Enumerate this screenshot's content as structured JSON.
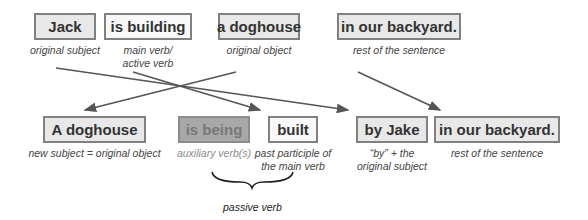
{
  "top_row": [
    {
      "id": "jack",
      "label": "Jack",
      "caption": "original subject",
      "x": 34,
      "w": 62,
      "style": "light"
    },
    {
      "id": "is-building",
      "label": "is building",
      "caption": "main verb/\nactive verb",
      "x": 104,
      "w": 88,
      "style": "white"
    },
    {
      "id": "a-doghouse",
      "label": "a doghouse",
      "caption": "original object",
      "x": 218,
      "w": 82,
      "style": "light"
    },
    {
      "id": "in-our-backyard",
      "label": "in our backyard.",
      "caption": "rest of the sentence",
      "x": 337,
      "w": 124,
      "style": "light"
    }
  ],
  "bottom_row": [
    {
      "id": "a-doghouse-new",
      "label": "A doghouse",
      "caption": "new subject = original object",
      "x": 43,
      "w": 103,
      "style": "light"
    },
    {
      "id": "is-being",
      "label": "is being",
      "caption": "auxiliary verb(s)",
      "x": 178,
      "w": 72,
      "style": "dark"
    },
    {
      "id": "built",
      "label": "built",
      "caption": "past participle of\nthe main verb",
      "x": 268,
      "w": 50,
      "style": "white"
    },
    {
      "id": "by-jake",
      "label": "by Jake",
      "caption": "“by” + the\noriginal subject",
      "x": 356,
      "w": 72,
      "style": "light"
    },
    {
      "id": "in-our-backyard-new",
      "label": "in our backyard.",
      "caption": "rest of the sentence",
      "x": 434,
      "w": 126,
      "style": "light"
    }
  ],
  "arrows": [
    {
      "from": "jack",
      "to": "by-jake",
      "x1": 56,
      "y1": 68,
      "x2": 348,
      "y2": 110
    },
    {
      "from": "is-building",
      "to": "built",
      "x1": 133,
      "y1": 72,
      "x2": 260,
      "y2": 110
    },
    {
      "from": "a-doghouse",
      "to": "a-doghouse-new",
      "x1": 236,
      "y1": 72,
      "x2": 85,
      "y2": 110
    },
    {
      "from": "in-our-backyard",
      "to": "in-our-backyard-new",
      "x1": 358,
      "y1": 72,
      "x2": 440,
      "y2": 110
    }
  ],
  "brace": {
    "label": "passive verb",
    "x1": 212,
    "x2": 293,
    "y": 180
  },
  "colors": {
    "line": "#555555",
    "box_border": "#808080",
    "box_light": "#e8e8e8",
    "box_dark": "#a8a8a8"
  }
}
